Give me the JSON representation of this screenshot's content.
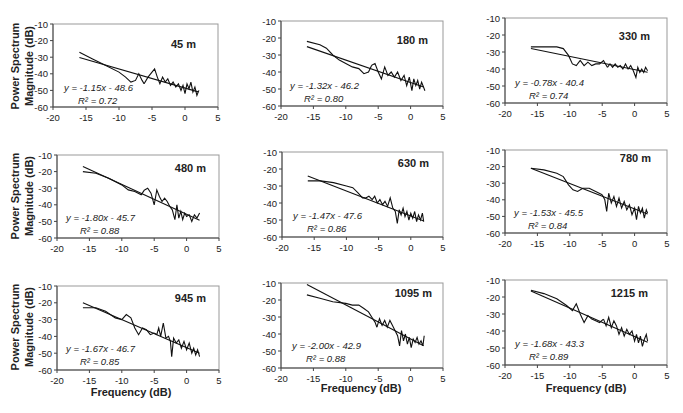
{
  "chart_data": [
    {
      "type": "line",
      "title": "45 m",
      "xlabel": "",
      "ylabel": "Power Spectrum Magnitude (dB)",
      "xlim": [
        -20,
        5
      ],
      "ylim": [
        -60,
        -10
      ],
      "xticks": [
        "-20",
        "-15",
        "-10",
        "-5",
        "0",
        "5"
      ],
      "yticks": [
        "-10",
        "-20",
        "-30",
        "-40",
        "-50",
        "-60"
      ],
      "equation": "y = -1.15x - 48.6",
      "r2": "R² = 0.72",
      "fit": {
        "slope": -1.15,
        "intercept": -48.6,
        "x_range": [
          -16,
          2
        ]
      },
      "series": [
        {
          "name": "smoothed",
          "x": [
            -16,
            -14,
            -12,
            -10,
            -9,
            -8.2,
            -7.5,
            -7,
            -6.5,
            -6.2
          ],
          "y": [
            -27,
            -31,
            -35,
            -39,
            -42,
            -45,
            -44,
            -40,
            -44,
            -46
          ]
        },
        {
          "name": "spectrum",
          "x": [
            -6.2,
            -5.6,
            -5,
            -4.6,
            -4.2,
            -3.8,
            -3.4,
            -3,
            -2.6,
            -2.2,
            -1.8,
            -1.4,
            -1,
            -0.6,
            -0.3,
            0,
            0.3,
            0.6,
            0.9,
            1.2,
            1.5,
            1.8,
            2.1
          ],
          "y": [
            -46,
            -42,
            -39,
            -37,
            -42,
            -46,
            -42,
            -45,
            -43,
            -47,
            -45,
            -48,
            -46,
            -50,
            -47,
            -52,
            -46,
            -49,
            -45,
            -51,
            -48,
            -53,
            -50
          ]
        }
      ]
    },
    {
      "type": "line",
      "title": "180 m",
      "xlabel": "",
      "ylabel": "",
      "xlim": [
        -20,
        5
      ],
      "ylim": [
        -60,
        -10
      ],
      "xticks": [
        "-20",
        "-15",
        "-10",
        "-5",
        "0",
        "5"
      ],
      "yticks": [
        "-10",
        "-20",
        "-30",
        "-40",
        "-50",
        "-60"
      ],
      "equation": "y = -1.32x - 46.2",
      "r2": "R² = 0.80",
      "fit": {
        "slope": -1.32,
        "intercept": -46.2,
        "x_range": [
          -16,
          2
        ]
      },
      "series": [
        {
          "name": "smoothed",
          "x": [
            -16,
            -14,
            -13,
            -12,
            -11,
            -10,
            -9,
            -8,
            -7.2,
            -6.5,
            -6
          ],
          "y": [
            -22,
            -24,
            -26,
            -30,
            -33,
            -35,
            -37,
            -38,
            -41,
            -40,
            -36
          ]
        },
        {
          "name": "spectrum",
          "x": [
            -6,
            -5.5,
            -5,
            -4.5,
            -4,
            -3.5,
            -3,
            -2.5,
            -2,
            -1.5,
            -1,
            -0.6,
            -0.2,
            0.2,
            0.5,
            0.8,
            1.1,
            1.4,
            1.7,
            2,
            2.2
          ],
          "y": [
            -36,
            -35,
            -40,
            -44,
            -37,
            -42,
            -40,
            -43,
            -40,
            -45,
            -42,
            -48,
            -43,
            -51,
            -44,
            -48,
            -45,
            -50,
            -46,
            -49,
            -51
          ]
        }
      ]
    },
    {
      "type": "line",
      "title": "330 m",
      "xlabel": "",
      "ylabel": "",
      "xlim": [
        -20,
        5
      ],
      "ylim": [
        -60,
        -10
      ],
      "xticks": [
        "-20",
        "-15",
        "-10",
        "-5",
        "0",
        "5"
      ],
      "yticks": [
        "-10",
        "-20",
        "-30",
        "-40",
        "-50",
        "-60"
      ],
      "equation": "y = -0.78x - 40.4",
      "r2": "R² = 0.74",
      "fit": {
        "slope": -0.78,
        "intercept": -40.4,
        "x_range": [
          -16,
          2
        ]
      },
      "series": [
        {
          "name": "smoothed",
          "x": [
            -16,
            -14,
            -12,
            -11,
            -10.2,
            -9.6,
            -9,
            -8.4,
            -7.8,
            -7.2,
            -6.6,
            -6,
            -5.4,
            -4.8,
            -4.2
          ],
          "y": [
            -27,
            -27,
            -27,
            -28,
            -32,
            -37,
            -38,
            -35,
            -38,
            -36,
            -38,
            -37,
            -37,
            -35,
            -39
          ]
        },
        {
          "name": "spectrum",
          "x": [
            -4.2,
            -3.8,
            -3.4,
            -3,
            -2.6,
            -2.2,
            -1.8,
            -1.4,
            -1,
            -0.6,
            -0.2,
            0.2,
            0.5,
            0.8,
            1.1,
            1.4,
            1.7,
            2
          ],
          "y": [
            -39,
            -37,
            -39,
            -37,
            -39,
            -38,
            -40,
            -37,
            -40,
            -38,
            -41,
            -45,
            -39,
            -42,
            -40,
            -42,
            -39,
            -41
          ]
        }
      ]
    },
    {
      "type": "line",
      "title": "480 m",
      "xlabel": "",
      "ylabel": "Power Spectrum Magnitude (dB)",
      "xlim": [
        -20,
        5
      ],
      "ylim": [
        -60,
        -10
      ],
      "xticks": [
        "-20",
        "-15",
        "-10",
        "-5",
        "0",
        "5"
      ],
      "yticks": [
        "-10",
        "-20",
        "-30",
        "-40",
        "-50",
        "-60"
      ],
      "equation": "y = -1.80x - 45.7",
      "r2": "R² = 0.88",
      "fit": {
        "slope": -1.8,
        "intercept": -45.7,
        "x_range": [
          -16,
          2
        ]
      },
      "series": [
        {
          "name": "smoothed",
          "x": [
            -16,
            -14,
            -12,
            -10,
            -9,
            -8,
            -7,
            -6.5
          ],
          "y": [
            -20,
            -21,
            -24,
            -28,
            -31,
            -32,
            -34,
            -31
          ]
        },
        {
          "name": "spectrum",
          "x": [
            -6.5,
            -6,
            -5.5,
            -5,
            -4.6,
            -4.2,
            -3.8,
            -3.4,
            -3,
            -2.6,
            -2.2,
            -1.8,
            -1.5,
            -1.2,
            -0.9,
            -0.6,
            -0.3,
            0,
            0.4,
            0.8,
            1.2,
            1.6,
            2
          ],
          "y": [
            -31,
            -30,
            -33,
            -40,
            -31,
            -35,
            -38,
            -36,
            -38,
            -41,
            -43,
            -49,
            -40,
            -48,
            -44,
            -49,
            -45,
            -47,
            -46,
            -50,
            -46,
            -48,
            -45
          ]
        }
      ]
    },
    {
      "type": "line",
      "title": "630 m",
      "xlabel": "",
      "ylabel": "",
      "xlim": [
        -20,
        5
      ],
      "ylim": [
        -60,
        -10
      ],
      "xticks": [
        "-20",
        "-15",
        "-10",
        "-5",
        "0",
        "5"
      ],
      "yticks": [
        "-10",
        "-20",
        "-30",
        "-40",
        "-50",
        "-60"
      ],
      "equation": "y = -1.47x - 47.6",
      "r2": "R² = 0.86",
      "fit": {
        "slope": -1.47,
        "intercept": -47.6,
        "x_range": [
          -16,
          2
        ]
      },
      "series": [
        {
          "name": "smoothed",
          "x": [
            -16,
            -14,
            -12,
            -10,
            -9,
            -8.2,
            -7.5,
            -7
          ],
          "y": [
            -27,
            -27,
            -28,
            -30,
            -31,
            -34,
            -37,
            -37
          ]
        },
        {
          "name": "spectrum",
          "x": [
            -7,
            -6.5,
            -6,
            -5.6,
            -5.2,
            -4.8,
            -4.4,
            -4,
            -3.6,
            -3.2,
            -2.8,
            -2.4,
            -2.1,
            -1.8,
            -1.5,
            -1.2,
            -0.9,
            -0.6,
            -0.3,
            0,
            0.3,
            0.6,
            0.9,
            1.2,
            1.5,
            1.8,
            2
          ],
          "y": [
            -37,
            -36,
            -38,
            -36,
            -40,
            -38,
            -41,
            -39,
            -42,
            -37,
            -43,
            -45,
            -52,
            -44,
            -47,
            -43,
            -48,
            -45,
            -50,
            -46,
            -49,
            -45,
            -51,
            -47,
            -50,
            -46,
            -51
          ]
        }
      ]
    },
    {
      "type": "line",
      "title": "780 m",
      "xlabel": "",
      "ylabel": "",
      "xlim": [
        -20,
        5
      ],
      "ylim": [
        -60,
        -10
      ],
      "xticks": [
        "-20",
        "-15",
        "-10",
        "-5",
        "0",
        "5"
      ],
      "yticks": [
        "-10",
        "-20",
        "-30",
        "-40",
        "-50",
        "-60"
      ],
      "equation": "y = -1.53x - 45.5",
      "r2": "R² = 0.84",
      "fit": {
        "slope": -1.53,
        "intercept": -45.5,
        "x_range": [
          -16,
          2
        ]
      },
      "series": [
        {
          "name": "smoothed",
          "x": [
            -16,
            -14,
            -12,
            -11,
            -10.2,
            -9.5,
            -8.8,
            -8,
            -7,
            -6,
            -5
          ],
          "y": [
            -21,
            -22,
            -24,
            -26,
            -31,
            -34,
            -35,
            -33,
            -33,
            -35,
            -37
          ]
        },
        {
          "name": "spectrum",
          "x": [
            -5,
            -4.6,
            -4.3,
            -4,
            -3.6,
            -3.2,
            -2.8,
            -2.4,
            -2,
            -1.6,
            -1.2,
            -0.8,
            -0.4,
            0,
            0.3,
            0.6,
            0.9,
            1.2,
            1.5,
            1.8,
            2
          ],
          "y": [
            -37,
            -40,
            -47,
            -36,
            -42,
            -38,
            -44,
            -39,
            -45,
            -41,
            -46,
            -43,
            -49,
            -45,
            -52,
            -44,
            -48,
            -45,
            -51,
            -46,
            -48
          ]
        }
      ]
    },
    {
      "type": "line",
      "title": "945 m",
      "xlabel": "Frequency (dB)",
      "ylabel": "Power Spectrum Magnitude (dB)",
      "xlim": [
        -20,
        5
      ],
      "ylim": [
        -60,
        -10
      ],
      "xticks": [
        "-20",
        "-15",
        "-10",
        "-5",
        "0",
        "5"
      ],
      "yticks": [
        "-10",
        "-20",
        "-30",
        "-40",
        "-50",
        "-60"
      ],
      "equation": "y = -1.67x - 46.7",
      "r2": "R² = 0.85",
      "fit": {
        "slope": -1.67,
        "intercept": -46.7,
        "x_range": [
          -16,
          2
        ]
      },
      "series": [
        {
          "name": "smoothed",
          "x": [
            -16,
            -14,
            -12.5,
            -11,
            -10,
            -9.3,
            -8.6,
            -8,
            -7.4,
            -6.8,
            -6.2,
            -5.6,
            -5
          ],
          "y": [
            -23,
            -23,
            -25,
            -29,
            -30,
            -27,
            -29,
            -35,
            -39,
            -35,
            -36,
            -39,
            -38
          ]
        },
        {
          "name": "spectrum",
          "x": [
            -5,
            -4.6,
            -4.3,
            -4,
            -3.6,
            -3.2,
            -2.8,
            -2.5,
            -2.3,
            -2,
            -1.6,
            -1.2,
            -0.8,
            -0.4,
            0,
            0.4,
            0.8,
            1.1,
            1.4,
            1.7,
            2
          ],
          "y": [
            -38,
            -39,
            -35,
            -40,
            -32,
            -41,
            -40,
            -43,
            -52,
            -41,
            -44,
            -42,
            -47,
            -43,
            -48,
            -44,
            -50,
            -47,
            -51,
            -48,
            -52
          ]
        }
      ]
    },
    {
      "type": "line",
      "title": "1095  m",
      "xlabel": "Frequency (dB)",
      "ylabel": "",
      "xlim": [
        -20,
        5
      ],
      "ylim": [
        -60,
        -10
      ],
      "xticks": [
        "-20",
        "-15",
        "-10",
        "-5",
        "0",
        "5"
      ],
      "yticks": [
        "-10",
        "-20",
        "-30",
        "-40",
        "-50",
        "-60"
      ],
      "equation": "y = -2.00x - 42.9",
      "r2": "R² = 0.88",
      "fit": {
        "slope": -2.0,
        "intercept": -42.9,
        "x_range": [
          -16,
          2
        ]
      },
      "series": [
        {
          "name": "smoothed",
          "x": [
            -16,
            -14,
            -12,
            -10,
            -9,
            -8,
            -7.2,
            -6.5,
            -6,
            -5.5,
            -5.2
          ],
          "y": [
            -17,
            -19,
            -21,
            -22,
            -23,
            -23,
            -25,
            -27,
            -30,
            -33,
            -36
          ]
        },
        {
          "name": "spectrum",
          "x": [
            -5.2,
            -4.8,
            -4.4,
            -4,
            -3.6,
            -3.2,
            -2.8,
            -2.4,
            -2,
            -1.7,
            -1.4,
            -1.1,
            -0.8,
            -0.5,
            -0.2,
            0.1,
            0.4,
            0.7,
            1,
            1.3,
            1.6,
            1.9,
            2.1
          ],
          "y": [
            -36,
            -31,
            -35,
            -32,
            -36,
            -32,
            -35,
            -38,
            -41,
            -47,
            -38,
            -44,
            -40,
            -46,
            -42,
            -48,
            -43,
            -45,
            -42,
            -46,
            -44,
            -47,
            -41
          ]
        }
      ]
    },
    {
      "type": "line",
      "title": "1215 m",
      "xlabel": "Frequency (dB)",
      "ylabel": "",
      "xlim": [
        -20,
        5
      ],
      "ylim": [
        -60,
        -10
      ],
      "xticks": [
        "-20",
        "-15",
        "-10",
        "-5",
        "0",
        "5"
      ],
      "yticks": [
        "-10",
        "-20",
        "-30",
        "-40",
        "-50",
        "-60"
      ],
      "equation": "y = -1.68x - 43.3",
      "r2": "R² = 0.89",
      "fit": {
        "slope": -1.68,
        "intercept": -43.3,
        "x_range": [
          -16,
          2
        ]
      },
      "series": [
        {
          "name": "smoothed",
          "x": [
            -16,
            -14,
            -12,
            -10.5,
            -9.6,
            -9,
            -8.4,
            -7.8,
            -7.2,
            -6.6,
            -6,
            -5.4,
            -4.8
          ],
          "y": [
            -16,
            -18,
            -21,
            -25,
            -28,
            -24,
            -30,
            -35,
            -31,
            -33,
            -34,
            -35,
            -33
          ]
        },
        {
          "name": "spectrum",
          "x": [
            -4.8,
            -4.4,
            -4,
            -3.6,
            -3.2,
            -2.8,
            -2.4,
            -2,
            -1.6,
            -1.2,
            -0.8,
            -0.4,
            0,
            0.3,
            0.6,
            0.9,
            1.2,
            1.5,
            1.8,
            2
          ],
          "y": [
            -33,
            -37,
            -32,
            -38,
            -34,
            -37,
            -42,
            -38,
            -43,
            -39,
            -42,
            -40,
            -46,
            -42,
            -47,
            -43,
            -49,
            -45,
            -42,
            -46
          ]
        }
      ]
    }
  ],
  "axis_titles": {
    "ylabel": "Power Spectrum Magnitude (dB)",
    "ylabel_line1": "Power Spectrum",
    "ylabel_line2": "Magnitude (dB)",
    "xlabel": "Frequency (dB)"
  }
}
